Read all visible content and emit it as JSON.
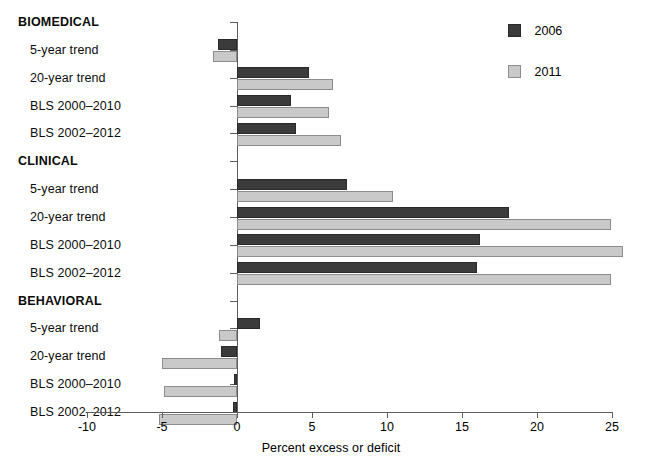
{
  "chart_data": {
    "type": "bar",
    "orientation": "horizontal",
    "title": "",
    "xlabel": "Percent excess or deficit",
    "ylabel": "",
    "xlim": [
      -10,
      25
    ],
    "xticks": [
      -10,
      -5,
      0,
      5,
      10,
      15,
      20,
      25
    ],
    "xticklabels": [
      "-10",
      "-5",
      "0",
      "5",
      "10",
      "15",
      "20",
      "25"
    ],
    "grid": false,
    "legend_position": "top-right",
    "legend": [
      "2006",
      "2011"
    ],
    "series": [
      {
        "name": "2006",
        "color": "#3b3b3b",
        "values": [
          null,
          -1.3,
          4.8,
          3.6,
          3.9,
          null,
          7.3,
          18.1,
          16.2,
          16.0,
          null,
          1.5,
          -1.1,
          -0.2,
          -0.3
        ]
      },
      {
        "name": "2011",
        "color": "#c9c9c9",
        "values": [
          null,
          -1.6,
          6.4,
          6.1,
          6.9,
          null,
          10.4,
          24.9,
          25.7,
          24.9,
          null,
          -1.2,
          -5.0,
          -4.9,
          -5.2
        ]
      }
    ],
    "categories": [
      {
        "label": "BIOMEDICAL",
        "type": "group"
      },
      {
        "label": "5-year trend",
        "type": "item"
      },
      {
        "label": "20-year trend",
        "type": "item"
      },
      {
        "label": "BLS 2000–2010",
        "type": "item"
      },
      {
        "label": "BLS 2002–2012",
        "type": "item"
      },
      {
        "label": "CLINICAL",
        "type": "group"
      },
      {
        "label": "5-year trend",
        "type": "item"
      },
      {
        "label": "20-year trend",
        "type": "item"
      },
      {
        "label": "BLS 2000–2010",
        "type": "item"
      },
      {
        "label": "BLS 2002–2012",
        "type": "item"
      },
      {
        "label": "BEHAVIORAL",
        "type": "group"
      },
      {
        "label": "5-year trend",
        "type": "item"
      },
      {
        "label": "20-year trend",
        "type": "item"
      },
      {
        "label": "BLS 2000–2010",
        "type": "item"
      },
      {
        "label": "BLS 2002–2012",
        "type": "item"
      }
    ]
  }
}
